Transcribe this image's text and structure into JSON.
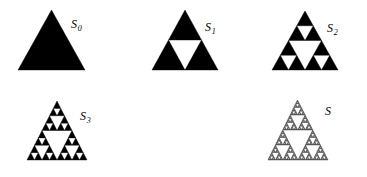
{
  "figure": {
    "background_color": "#ffffff",
    "ink_color": "#000000",
    "width": 367,
    "height": 177,
    "panels": [
      {
        "id": "S0",
        "label_main": "S",
        "label_sub": "0",
        "iteration": 0,
        "fill_mode": "solid",
        "stroke_width": 0,
        "triangle": {
          "apex_x": 51.5,
          "apex_y": 10,
          "base_y": 70,
          "left_x": 18,
          "right_x": 85
        },
        "label_pos": {
          "x": 71,
          "y": 18
        }
      },
      {
        "id": "S1",
        "label_main": "S",
        "label_sub": "1",
        "iteration": 1,
        "fill_mode": "solid",
        "stroke_width": 0,
        "triangle": {
          "apex_x": 185,
          "apex_y": 10,
          "base_y": 70,
          "left_x": 152,
          "right_x": 218
        },
        "label_pos": {
          "x": 205,
          "y": 21
        }
      },
      {
        "id": "S2",
        "label_main": "S",
        "label_sub": "2",
        "iteration": 2,
        "fill_mode": "solid",
        "stroke_width": 0,
        "triangle": {
          "apex_x": 305,
          "apex_y": 11,
          "base_y": 70,
          "left_x": 272,
          "right_x": 338
        },
        "label_pos": {
          "x": 327,
          "y": 22
        }
      },
      {
        "id": "S3",
        "label_main": "S",
        "label_sub": "3",
        "iteration": 3,
        "fill_mode": "solid",
        "stroke_width": 0,
        "triangle": {
          "apex_x": 57,
          "apex_y": 101,
          "base_y": 160,
          "left_x": 27,
          "right_x": 87
        },
        "label_pos": {
          "x": 80,
          "y": 110
        }
      },
      {
        "id": "S",
        "label_main": "S",
        "label_sub": "",
        "iteration": 6,
        "fill_mode": "outline",
        "stroke_width": 0.35,
        "triangle": {
          "apex_x": 297.5,
          "apex_y": 100,
          "base_y": 160,
          "left_x": 268,
          "right_x": 328
        },
        "label_pos": {
          "x": 325,
          "y": 105
        }
      }
    ]
  }
}
